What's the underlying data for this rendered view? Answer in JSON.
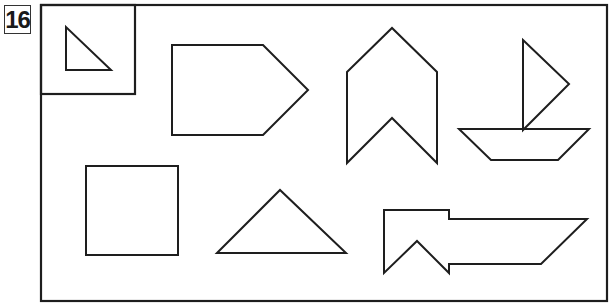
{
  "puzzle": {
    "number": "16",
    "stroke_color": "#1e1e1e",
    "background_color": "#ffffff"
  },
  "frame": {
    "outer": {
      "x": 41,
      "y": 5,
      "width": 566,
      "height": 296
    },
    "example_box": {
      "x": 41,
      "y": 5,
      "width": 94,
      "height": 89
    }
  },
  "shapes": [
    {
      "name": "example-small-right-triangle",
      "points": "66,27 66,70 111,70"
    },
    {
      "name": "pentagon-arrow",
      "points": "172,45 263,45 308,90 263,135 172,135"
    },
    {
      "name": "chevron-up",
      "points": "347,72 392,28 437,72 437,163 392,118 347,163"
    },
    {
      "name": "sailboat-sail-triangle",
      "points": "523,40 569,84 523,130"
    },
    {
      "name": "sailboat-hull-trapezoid",
      "points": "459,129 589,129 558,160 491,160"
    },
    {
      "name": "square",
      "points": "86,166 178,166 178,255 86,255"
    },
    {
      "name": "triangle-isosceles",
      "points": "217,253 280,190 346,253"
    },
    {
      "name": "flag-arrow-notched",
      "points": "384,210 449,210 449,219 587,219 541,264 449,264 449,273 417,241 384,273"
    }
  ]
}
